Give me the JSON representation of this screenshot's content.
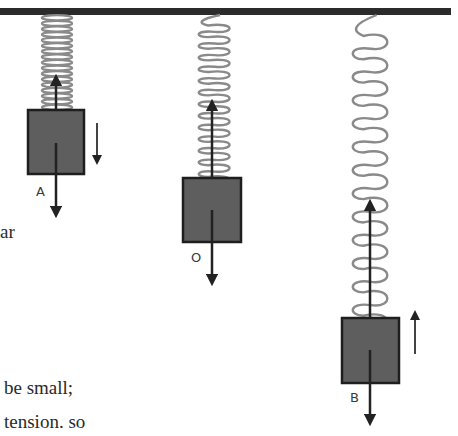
{
  "diagram": {
    "colors": {
      "ceiling": "#2b2b2b",
      "spring": "#8a8a8a",
      "block_fill": "#5e5e5e",
      "block_stroke": "#1e1e1e",
      "arrow": "#222222",
      "background": "#ffffff"
    },
    "ceiling": {
      "x": 0,
      "y": 8,
      "width": 451,
      "height": 7
    },
    "masses": [
      {
        "label": "A",
        "position": "top",
        "spring": {
          "state": "compressed",
          "x": 42,
          "width": 30,
          "top": 15,
          "bottom": 110,
          "coils": 17
        },
        "block": {
          "x": 28,
          "y": 110,
          "width": 56,
          "height": 64
        },
        "force_up": {
          "x": 56,
          "from": 110,
          "to": 80
        },
        "force_down": {
          "x": 56,
          "from": 143,
          "to": 212
        },
        "velocity_arrow": {
          "direction": "down",
          "x": 97,
          "from": 123,
          "to": 160
        },
        "label_pos": {
          "x": 36,
          "y": 196
        }
      },
      {
        "label": "O",
        "position": "equilibrium",
        "spring": {
          "state": "natural",
          "x": 198,
          "width": 34,
          "top": 15,
          "bottom": 178,
          "coils": 14
        },
        "block": {
          "x": 183,
          "y": 178,
          "width": 58,
          "height": 64
        },
        "force_up": {
          "x": 212,
          "from": 178,
          "to": 105
        },
        "force_down": {
          "x": 212,
          "from": 210,
          "to": 280
        },
        "velocity_arrow": null,
        "label_pos": {
          "x": 191,
          "y": 262
        }
      },
      {
        "label": "B",
        "position": "bottom",
        "spring": {
          "state": "stretched",
          "x": 352,
          "width": 38,
          "top": 15,
          "bottom": 318,
          "coils": 13
        },
        "block": {
          "x": 342,
          "y": 318,
          "width": 57,
          "height": 65
        },
        "force_up": {
          "x": 370,
          "from": 318,
          "to": 205
        },
        "force_down": {
          "x": 370,
          "from": 350,
          "to": 420
        },
        "velocity_arrow": {
          "direction": "up",
          "x": 415,
          "from": 354,
          "to": 315
        },
        "label_pos": {
          "x": 350,
          "y": 402
        }
      }
    ]
  },
  "text_fragments": [
    {
      "id": "frag-ar",
      "text": "ar",
      "x": 0,
      "y": 222
    },
    {
      "id": "frag-be-small",
      "text": "be small;",
      "x": 4,
      "y": 378
    },
    {
      "id": "frag-tension-so",
      "text": "tension. so",
      "x": 4,
      "y": 412
    }
  ]
}
